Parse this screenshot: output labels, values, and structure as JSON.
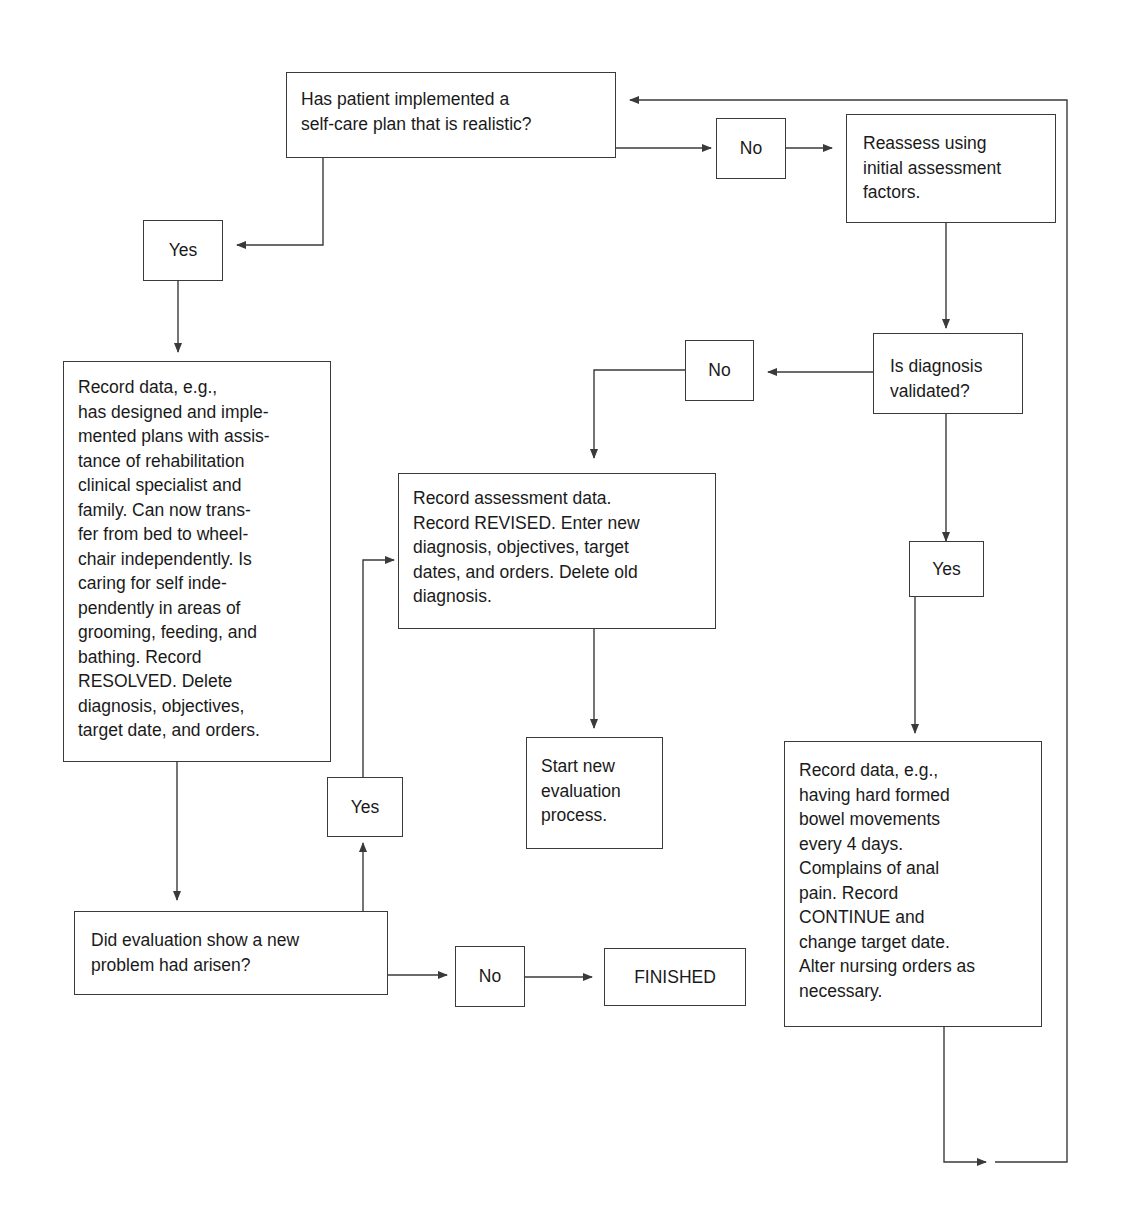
{
  "diagram": {
    "type": "flowchart",
    "nodes": {
      "q_selfcare": "Has patient implemented a\nself-care plan that is realistic?",
      "no_1": "No",
      "reassess": "Reassess using\ninitial assessment\nfactors.",
      "yes_1": "Yes",
      "record_resolved": "Record data, e.g.,\nhas designed and imple-\nmented plans with assis-\ntance of rehabilitation\nclinical specialist and\nfamily. Can now trans-\nfer from bed to wheel-\nchair independently. Is\ncaring for self inde-\npendently in areas of\ngrooming, feeding, and\nbathing. Record\nRESOLVED. Delete\ndiagnosis, objectives,\ntarget date, and orders.",
      "q_validated": "Is diagnosis\nvalidated?",
      "no_2": "No",
      "record_revised": "Record assessment data.\nRecord REVISED. Enter new\ndiagnosis, objectives, target\ndates, and orders. Delete old\ndiagnosis.",
      "yes_2": "Yes",
      "start_new": "Start new\nevaluation\nprocess.",
      "yes_3": "Yes",
      "q_new_problem": "Did evaluation show a new\nproblem had arisen?",
      "no_3": "No",
      "finished": "FINISHED",
      "record_continue": "Record data, e.g.,\nhaving hard formed\nbowel movements\nevery 4 days.\nComplains of anal\npain. Record\nCONTINUE and\nchange target date.\nAlter nursing orders as\nnecessary."
    },
    "edges": [
      {
        "from": "q_selfcare",
        "to": "no_1"
      },
      {
        "from": "no_1",
        "to": "reassess"
      },
      {
        "from": "q_selfcare",
        "to": "yes_1"
      },
      {
        "from": "yes_1",
        "to": "record_resolved"
      },
      {
        "from": "reassess",
        "to": "q_validated"
      },
      {
        "from": "q_validated",
        "to": "no_2"
      },
      {
        "from": "no_2",
        "to": "record_revised"
      },
      {
        "from": "record_revised",
        "to": "start_new"
      },
      {
        "from": "q_validated",
        "to": "yes_2"
      },
      {
        "from": "yes_2",
        "to": "record_continue"
      },
      {
        "from": "record_continue",
        "to": "q_selfcare"
      },
      {
        "from": "record_resolved",
        "to": "q_new_problem"
      },
      {
        "from": "q_new_problem",
        "to": "yes_3"
      },
      {
        "from": "yes_3",
        "to": "record_revised"
      },
      {
        "from": "q_new_problem",
        "to": "no_3"
      },
      {
        "from": "no_3",
        "to": "finished"
      }
    ],
    "colors": {
      "line": "#3a3a3a",
      "text": "#1a1a1a",
      "background": "#ffffff"
    }
  }
}
